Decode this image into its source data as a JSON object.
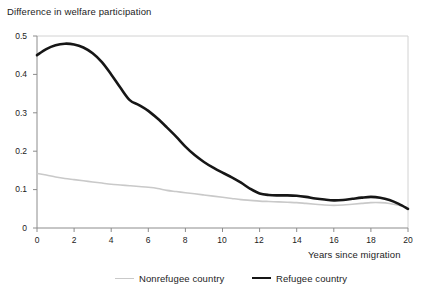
{
  "chart_data": {
    "type": "line",
    "title": "Difference in welfare participation",
    "xlabel": "Years since migration",
    "ylabel": "",
    "xlim": [
      0,
      20
    ],
    "ylim": [
      0,
      0.5
    ],
    "grid": false,
    "legend_position": "bottom",
    "x_ticks": [
      "0",
      "2",
      "4",
      "6",
      "8",
      "10",
      "12",
      "14",
      "16",
      "18",
      "20"
    ],
    "x_tick_values": [
      0,
      2,
      4,
      6,
      8,
      10,
      12,
      14,
      16,
      18,
      20
    ],
    "y_ticks": [
      "0",
      "0.1",
      "0.2",
      "0.3",
      "0.4",
      "0.5"
    ],
    "y_tick_values": [
      0,
      0.1,
      0.2,
      0.3,
      0.4,
      0.5
    ],
    "x": [
      0,
      0.5,
      1,
      1.5,
      2,
      2.5,
      3,
      3.5,
      4,
      4.5,
      5,
      5.5,
      6,
      6.5,
      7,
      7.5,
      8,
      8.5,
      9,
      9.5,
      10,
      10.5,
      11,
      11.5,
      12,
      12.5,
      13,
      13.5,
      14,
      14.5,
      15,
      15.5,
      16,
      16.5,
      17,
      17.5,
      18,
      18.5,
      19,
      19.5,
      20
    ],
    "series": [
      {
        "name": "Nonrefugee country",
        "color": "#c9c9c9",
        "width": 1.6,
        "values": [
          0.142,
          0.138,
          0.133,
          0.129,
          0.126,
          0.123,
          0.12,
          0.117,
          0.114,
          0.112,
          0.11,
          0.108,
          0.106,
          0.103,
          0.098,
          0.095,
          0.092,
          0.089,
          0.086,
          0.083,
          0.08,
          0.077,
          0.074,
          0.072,
          0.07,
          0.069,
          0.068,
          0.067,
          0.066,
          0.064,
          0.062,
          0.06,
          0.059,
          0.06,
          0.062,
          0.064,
          0.066,
          0.066,
          0.064,
          0.059,
          0.052
        ]
      },
      {
        "name": "Refugee country",
        "color": "#161616",
        "width": 2.6,
        "values": [
          0.45,
          0.466,
          0.476,
          0.48,
          0.478,
          0.47,
          0.455,
          0.432,
          0.4,
          0.365,
          0.333,
          0.32,
          0.305,
          0.285,
          0.262,
          0.238,
          0.212,
          0.19,
          0.172,
          0.157,
          0.144,
          0.132,
          0.118,
          0.102,
          0.09,
          0.086,
          0.085,
          0.085,
          0.084,
          0.081,
          0.077,
          0.074,
          0.072,
          0.073,
          0.076,
          0.079,
          0.081,
          0.079,
          0.073,
          0.063,
          0.05
        ]
      }
    ]
  },
  "legend": {
    "entries": [
      {
        "label": "Nonrefugee country"
      },
      {
        "label": "Refugee country"
      }
    ]
  },
  "axes": {
    "y_labels": [
      "0.5",
      "0.4",
      "0.3",
      "0.2",
      "0.1",
      "0"
    ],
    "x_labels": [
      "0",
      "2",
      "4",
      "6",
      "8",
      "10",
      "12",
      "14",
      "16",
      "18",
      "20"
    ]
  },
  "colors": {
    "refugee_line": "#161616",
    "nonrefugee_line": "#c9c9c9",
    "axis": "#8c8c8c",
    "frame": "#d2d2d2",
    "text": "#1c1c1c",
    "background": "#ffffff"
  }
}
